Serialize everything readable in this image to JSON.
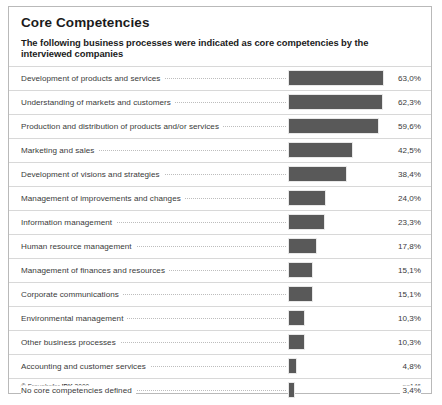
{
  "chart_data": {
    "type": "bar",
    "title": "Core Competencies",
    "subtitle": "The following business processes were indicated as core competencies by the interviewed companies",
    "orientation": "horizontal",
    "xlabel": "",
    "ylabel": "",
    "xlim": [
      0,
      70
    ],
    "grid": false,
    "legend": null,
    "value_suffix": "%",
    "decimal_separator": ",",
    "bar_color": "#595959",
    "categories": [
      "Development of products and services",
      "Understanding of markets and customers",
      "Production and distribution of products and/or services",
      "Marketing and sales",
      "Development of visions and strategies",
      "Management of improvements and changes",
      "Information management",
      "Human resource management",
      "Management of finances and resources",
      "Corporate communications",
      "Environmental management",
      "Other business processes",
      "Accounting and customer services",
      "No core competencies defined"
    ],
    "values": [
      63.0,
      62.3,
      59.6,
      42.5,
      38.4,
      24.0,
      23.3,
      17.8,
      15.1,
      15.1,
      10.3,
      10.3,
      4.8,
      3.4
    ],
    "value_labels": [
      "63,0%",
      "62,3%",
      "59,6%",
      "42,5%",
      "38,4%",
      "24,0%",
      "23,3%",
      "17,8%",
      "15,1%",
      "15,1%",
      "10,3%",
      "10,3%",
      "4,8%",
      "3,4%"
    ],
    "annotations": {
      "copyright": "© Fraunhofer IPK 2000",
      "copyright_prefix": "© Fraunhofer ",
      "copyright_bold": "IPK",
      "copyright_suffix": " 2000",
      "sample_size": "n=146"
    }
  }
}
